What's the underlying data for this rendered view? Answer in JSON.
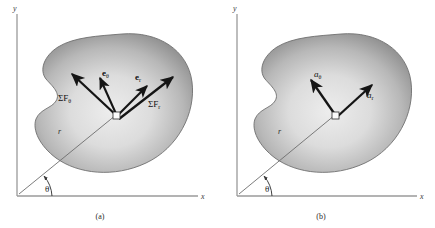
{
  "figure": {
    "background_color": "#ffffff",
    "blob_fill_light": "#e6e6e6",
    "blob_fill_dark": "#8f8f8f",
    "arrow_color": "#151515",
    "axis_color": "#9a9a9a"
  },
  "panels": [
    {
      "id": "a",
      "caption": "(a)",
      "axes": {
        "x_label": "x",
        "y_label": "y"
      },
      "angle_label": "θ",
      "radius_label": "r",
      "particle_name": "particle-marker",
      "vectors": [
        {
          "name": "sum-f-theta",
          "label_base": "ΣF",
          "label_sub": "θ",
          "kind": "force"
        },
        {
          "name": "sum-f-r",
          "label_base": "ΣF",
          "label_sub": "r",
          "kind": "force"
        },
        {
          "name": "e-theta",
          "label_base": "e",
          "label_sub": "θ",
          "kind": "unit"
        },
        {
          "name": "e-r",
          "label_base": "e",
          "label_sub": "r",
          "kind": "unit"
        }
      ]
    },
    {
      "id": "b",
      "caption": "(b)",
      "axes": {
        "x_label": "x",
        "y_label": "y"
      },
      "angle_label": "θ",
      "radius_label": "r",
      "particle_name": "particle-marker",
      "vectors": [
        {
          "name": "a-theta",
          "label_base": "a",
          "label_sub": "θ",
          "kind": "acceleration"
        },
        {
          "name": "a-r",
          "label_base": "a",
          "label_sub": "r",
          "kind": "acceleration"
        }
      ]
    }
  ]
}
